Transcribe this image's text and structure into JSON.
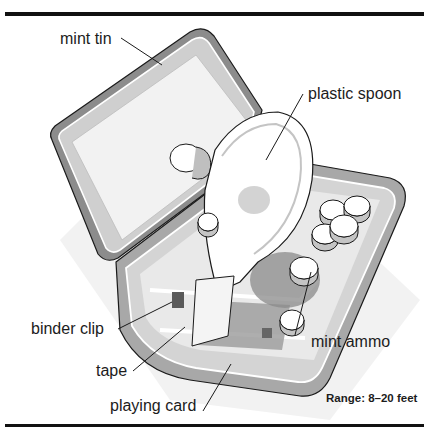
{
  "figure": {
    "type": "labeled-illustration",
    "labels": {
      "mint_tin": "mint tin",
      "plastic_spoon": "plastic spoon",
      "binder_clip": "binder clip",
      "tape": "tape",
      "playing_card": "playing card",
      "mint_ammo": "mint ammo"
    },
    "range_note": "Range: 8–20 feet"
  },
  "colors": {
    "rule": "#111111",
    "tin_dark": "#8c8c8c",
    "tin_mid": "#b5b5b5",
    "tin_light": "#e6e6e6",
    "shadow": "#7a7a7a"
  }
}
